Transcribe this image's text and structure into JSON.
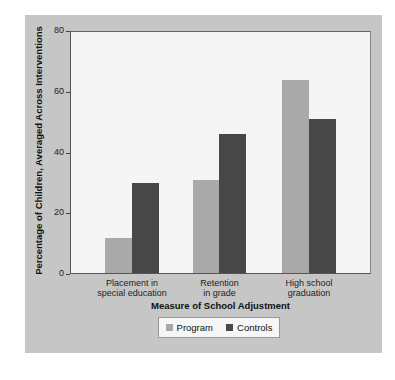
{
  "chart_data": {
    "type": "bar",
    "title": "",
    "xlabel": "Measure of School Adjustment",
    "ylabel": "Percentage of Children, Averaged Across Interventions",
    "ylim": [
      0,
      80
    ],
    "yticks": [
      "0",
      "20",
      "40",
      "60",
      "80"
    ],
    "categories": [
      "Placement in special education",
      "Retention in grade",
      "High school graduation"
    ],
    "category_lines": [
      [
        "Placement in",
        "special education"
      ],
      [
        "Retention",
        "in grade"
      ],
      [
        "High school",
        "graduation"
      ]
    ],
    "series": [
      {
        "name": "Program",
        "color": "#a9a9a9",
        "values": [
          12,
          31,
          64
        ]
      },
      {
        "name": "Controls",
        "color": "#474747",
        "values": [
          30,
          46,
          51
        ]
      }
    ],
    "legend_position": "bottom",
    "grid": false
  },
  "legend": {
    "program_label": "Program",
    "controls_label": "Controls"
  },
  "colors": {
    "panel": "#c6c6c6",
    "plot_background": "#f5f5f5",
    "program": "#a9a9a9",
    "controls": "#474747"
  }
}
